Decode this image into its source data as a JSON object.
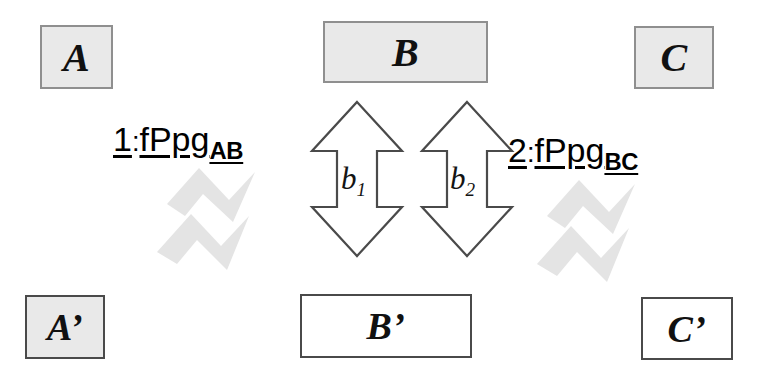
{
  "diagram": {
    "background_color": "#ffffff",
    "nodes": [
      {
        "id": "A",
        "label": "A",
        "fill": "#e9e9e9",
        "border": "#8f8f8f"
      },
      {
        "id": "B",
        "label": "B",
        "fill": "#e9e9e9",
        "border": "#8f8f8f"
      },
      {
        "id": "C",
        "label": "C",
        "fill": "#e9e9e9",
        "border": "#8f8f8f"
      },
      {
        "id": "Ap",
        "label": "A’",
        "fill": "#e9e9e9",
        "border": "#4a4a4a"
      },
      {
        "id": "Bp",
        "label": "B’",
        "fill": "#ffffff",
        "border": "#4a4a4a"
      },
      {
        "id": "Cp",
        "label": "C’",
        "fill": "#ffffff",
        "border": "#4a4a4a"
      }
    ],
    "bidirectional_arrows": [
      {
        "id": "b1",
        "label": "b",
        "subscript": "1",
        "stroke": "#4a4a4a",
        "fill": "#ffffff"
      },
      {
        "id": "b2",
        "label": "b",
        "subscript": "2",
        "stroke": "#4a4a4a",
        "fill": "#ffffff"
      }
    ],
    "relation_labels": [
      {
        "id": "rel-1",
        "number": "1",
        "separator": ":",
        "body": "fPpg",
        "subscript": "AB",
        "full": "1:fPpg_AB"
      },
      {
        "id": "rel-2",
        "number": "2",
        "separator": ":",
        "body": "fPpg",
        "subscript": "BC",
        "full": "2:fPpg_BC"
      }
    ],
    "chevrons": [
      {
        "id": "chevron-left",
        "direction": "down-right",
        "fill": "#e4e4e4"
      },
      {
        "id": "chevron-right",
        "direction": "down-right",
        "fill": "#e4e4e4"
      }
    ]
  }
}
